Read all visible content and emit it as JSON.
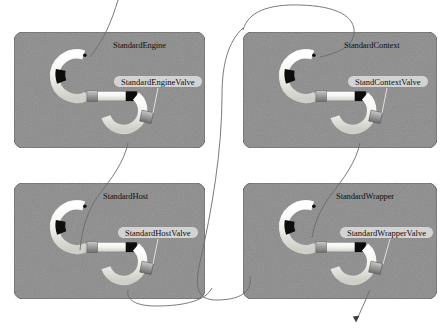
{
  "diagram": {
    "background_color": "#ffffff",
    "panel_fill": "#8c8c8c",
    "panel_border": "#5a5a5a",
    "pipe_light": "#f2f2ee",
    "pipe_band": "#0d0d0d",
    "pipe_coupling": "#9a9a9a",
    "label_fill": "#d3d3d3",
    "label_border": "#8f8f8f",
    "connector_color": "#6b6b6b"
  },
  "panels": [
    {
      "id": "standard-engine",
      "title": "StandardEngine",
      "valve_label": "StandardEngineValve",
      "x": 14,
      "y": 32,
      "w": 191,
      "h": 116
    },
    {
      "id": "standard-context",
      "title": "StandardContext",
      "valve_label": "StandContextValve",
      "x": 243,
      "y": 32,
      "w": 194,
      "h": 116
    },
    {
      "id": "standard-host",
      "title": "StandardHost",
      "valve_label": "StandardHostValve",
      "x": 14,
      "y": 183,
      "w": 191,
      "h": 116
    },
    {
      "id": "standard-wrapper",
      "title": "StandardWrapper",
      "valve_label": "StandardWrapperValve",
      "x": 243,
      "y": 183,
      "w": 194,
      "h": 116
    }
  ]
}
